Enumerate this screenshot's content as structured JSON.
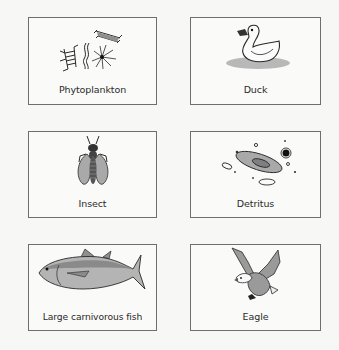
{
  "figure": {
    "cards": [
      {
        "id": "phytoplankton",
        "label": "Phytoplankton",
        "icon": "phytoplankton-icon"
      },
      {
        "id": "duck",
        "label": "Duck",
        "icon": "duck-icon"
      },
      {
        "id": "insect",
        "label": "Insect",
        "icon": "insect-icon"
      },
      {
        "id": "detritus",
        "label": "Detritus",
        "icon": "detritus-icon"
      },
      {
        "id": "large-carnivorous-fish",
        "label": "Large carnivorous fish",
        "icon": "fish-icon"
      },
      {
        "id": "eagle",
        "label": "Eagle",
        "icon": "eagle-icon"
      }
    ],
    "colors": {
      "border": "#6e6e6e",
      "fill_gray": "#a9a9a9",
      "line": "#2a2a2a"
    }
  }
}
